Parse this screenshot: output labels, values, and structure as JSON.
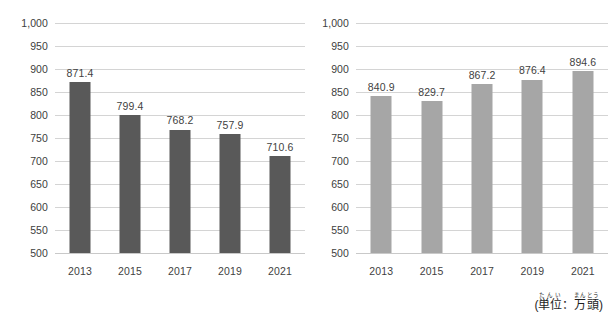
{
  "chart_data": [
    {
      "type": "bar",
      "name": "left-chart",
      "title": "",
      "xlabel": "",
      "ylabel": "",
      "categories": [
        "2013",
        "2015",
        "2017",
        "2019",
        "2021"
      ],
      "values": [
        871.4,
        799.4,
        768.2,
        757.9,
        710.6
      ],
      "value_labels": [
        "871.4",
        "799.4",
        "768.2",
        "757.9",
        "710.6"
      ],
      "ylim": [
        500,
        1000
      ],
      "ytick_values": [
        1000,
        950,
        900,
        850,
        800,
        750,
        700,
        650,
        600,
        550,
        500
      ],
      "ytick_labels": [
        "1,000",
        "950",
        "900",
        "850",
        "800",
        "750",
        "700",
        "650",
        "600",
        "550",
        "500"
      ],
      "grid": true,
      "legend": "none",
      "bar_color": "#595959",
      "grid_color": "#d4d4d4"
    },
    {
      "type": "bar",
      "name": "right-chart",
      "title": "",
      "xlabel": "",
      "ylabel": "",
      "categories": [
        "2013",
        "2015",
        "2017",
        "2019",
        "2021"
      ],
      "values": [
        840.9,
        829.7,
        867.2,
        876.4,
        894.6
      ],
      "value_labels": [
        "840.9",
        "829.7",
        "867.2",
        "876.4",
        "894.6"
      ],
      "ylim": [
        500,
        1000
      ],
      "ytick_values": [
        1000,
        950,
        900,
        850,
        800,
        750,
        700,
        650,
        600,
        550,
        500
      ],
      "ytick_labels": [
        "1,000",
        "950",
        "900",
        "850",
        "800",
        "750",
        "700",
        "650",
        "600",
        "550",
        "500"
      ],
      "grid": true,
      "legend": "none",
      "bar_color": "#a6a6a6",
      "grid_color": "#d4d4d4",
      "annotation": {
        "open_paren": "(",
        "close_paren": ")",
        "separator": "：",
        "term1_base": "単位",
        "term1_ruby": "たんい",
        "term2_base": "万頭",
        "term2_ruby": "まんとう",
        "plain_text": "(単位：万頭)"
      }
    }
  ]
}
